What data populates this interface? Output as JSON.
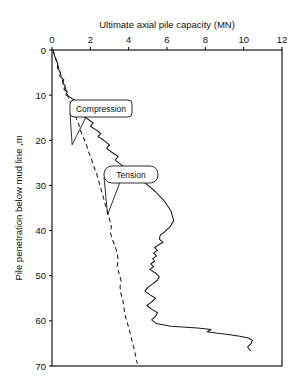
{
  "chart_data": {
    "type": "line",
    "title": "",
    "xlabel": "Ultimate axial pile capacity (MN)",
    "ylabel": "Pile penetration below mud line ,m",
    "xlim": [
      0,
      12
    ],
    "ylim": [
      0,
      70
    ],
    "y_axis_inverted": true,
    "grid": false,
    "legend_position": "inline-callouts",
    "xticks": [
      0,
      2,
      4,
      6,
      8,
      10,
      12
    ],
    "yticks": [
      0,
      10,
      20,
      30,
      40,
      50,
      60,
      70
    ],
    "xtick_labels": [
      "0",
      "2",
      "4",
      "6",
      "8",
      "10",
      "12"
    ],
    "ytick_labels": [
      "0",
      "10",
      "20",
      "30",
      "40",
      "50",
      "60",
      "70"
    ],
    "series": [
      {
        "name": "Compression",
        "style": "solid",
        "color": "#1a1a1a",
        "x": [
          0.05,
          0.15,
          0.3,
          0.28,
          0.45,
          0.4,
          0.62,
          0.55,
          0.7,
          0.62,
          0.8,
          0.72,
          0.95,
          1.2,
          1.0,
          1.25,
          1.5,
          1.35,
          1.6,
          1.9,
          2.15,
          2.0,
          2.3,
          2.55,
          2.4,
          2.7,
          3.0,
          2.85,
          3.1,
          3.45,
          3.3,
          3.6,
          4.0,
          4.4,
          4.9,
          5.4,
          5.85,
          6.2,
          6.35,
          6.15,
          5.9,
          5.65,
          5.6,
          5.8,
          5.55,
          5.35,
          5.5,
          5.3,
          5.45,
          5.25,
          5.35,
          5.15,
          5.3,
          5.1,
          5.4,
          5.6,
          5.5,
          5.25,
          5.0,
          4.85,
          5.1,
          5.4,
          5.2,
          4.95,
          5.2,
          5.5,
          5.4,
          5.2,
          5.45,
          6.2,
          7.6,
          8.3,
          8.1,
          8.55,
          9.2,
          9.8,
          10.25,
          10.45,
          10.4,
          10.2,
          10.35
        ],
        "y": [
          0.0,
          1.5,
          3.0,
          4.0,
          5.0,
          5.8,
          6.6,
          7.3,
          8.0,
          8.7,
          9.3,
          9.9,
          10.5,
          11.2,
          11.8,
          12.4,
          13.2,
          13.9,
          14.6,
          15.4,
          16.2,
          16.9,
          17.7,
          18.5,
          19.2,
          20.0,
          21.0,
          21.8,
          22.6,
          23.6,
          24.4,
          25.4,
          26.6,
          28.0,
          29.6,
          31.4,
          33.4,
          35.6,
          37.8,
          39.2,
          40.2,
          41.0,
          41.9,
          42.6,
          43.2,
          43.8,
          44.4,
          45.0,
          45.6,
          46.2,
          46.8,
          47.4,
          48.0,
          48.6,
          49.4,
          50.2,
          51.0,
          51.8,
          52.6,
          53.4,
          54.2,
          55.0,
          55.8,
          56.6,
          57.4,
          58.2,
          59.0,
          59.8,
          60.6,
          61.2,
          61.6,
          61.9,
          62.4,
          62.7,
          63.0,
          63.4,
          63.8,
          64.3,
          65.0,
          65.8,
          66.6
        ]
      },
      {
        "name": "Tension",
        "style": "dashed",
        "color": "#1a1a1a",
        "x": [
          0.05,
          0.2,
          0.35,
          0.5,
          0.6,
          0.75,
          0.85,
          1.0,
          1.1,
          1.25,
          1.4,
          1.5,
          1.65,
          1.8,
          1.9,
          2.05,
          2.15,
          2.3,
          2.4,
          2.5,
          2.6,
          2.7,
          2.8,
          2.9,
          3.0,
          3.1,
          3.05,
          3.15,
          3.3,
          3.4,
          3.45,
          3.4,
          3.5,
          3.6,
          3.55,
          3.6,
          3.7,
          3.75,
          3.8,
          3.9,
          4.0,
          4.15,
          4.3,
          4.45
        ],
        "y": [
          0.0,
          2.0,
          4.0,
          6.0,
          7.5,
          9.0,
          10.5,
          12.0,
          13.5,
          15.0,
          16.5,
          18.0,
          19.5,
          21.0,
          22.5,
          24.0,
          25.5,
          27.0,
          28.5,
          30.0,
          31.5,
          33.0,
          34.5,
          36.0,
          37.5,
          39.0,
          40.5,
          42.0,
          43.5,
          45.0,
          46.5,
          48.0,
          49.5,
          51.0,
          52.5,
          54.0,
          55.5,
          57.0,
          58.5,
          60.0,
          61.5,
          64.0,
          66.5,
          69.5
        ]
      }
    ],
    "annotations": [
      {
        "name": "compression",
        "label": "Compression",
        "points_to_x": 1.05,
        "points_to_y": 21.0
      },
      {
        "name": "tension",
        "label": "Tension",
        "points_to_x": 2.9,
        "points_to_y": 36.5
      }
    ]
  }
}
